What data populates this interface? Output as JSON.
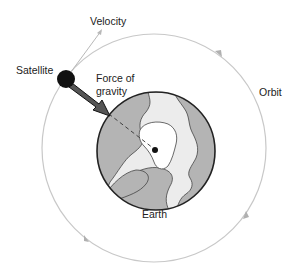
{
  "diagram": {
    "labels": {
      "velocity": "Velocity",
      "satellite": "Satellite",
      "force_line1": "Force of",
      "force_line2": "gravity",
      "orbit": "Orbit",
      "earth": "Earth"
    },
    "colors": {
      "orbit": "#c8c8c8",
      "earth_ocean": "#b4b4b4",
      "earth_land": "#ececec",
      "earth_inner": "#ffffff",
      "satellite": "#111111",
      "gravity_arrow": "#555555"
    }
  }
}
